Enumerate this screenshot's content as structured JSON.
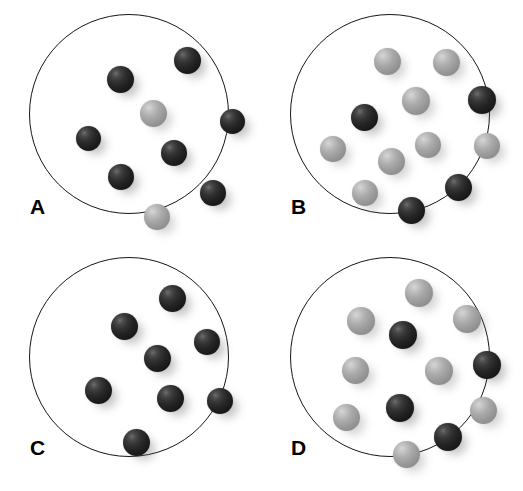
{
  "figure": {
    "background_color": "#ffffff",
    "width": 523,
    "height": 491
  },
  "legend_colors": {
    "dark_sphere": "#242424",
    "light_sphere": "#a5a5a5",
    "dish_outline": "#161616",
    "background": "#ffffff"
  },
  "panels": [
    {
      "id": "panel-a",
      "label": "A",
      "label_x": 30,
      "label_y": 196,
      "dish": {
        "x": 29,
        "y": 14,
        "size": 200
      },
      "counts": {
        "dark": 7,
        "light": 2,
        "total": 9
      },
      "spheres": [
        {
          "type": "dark",
          "x": 145,
          "y": 33,
          "d": 27
        },
        {
          "type": "dark",
          "x": 78,
          "y": 52,
          "d": 27
        },
        {
          "type": "light",
          "x": 111,
          "y": 86,
          "d": 27
        },
        {
          "type": "dark",
          "x": 191,
          "y": 95,
          "d": 25
        },
        {
          "type": "dark",
          "x": 47,
          "y": 112,
          "d": 25
        },
        {
          "type": "dark",
          "x": 132,
          "y": 126,
          "d": 26
        },
        {
          "type": "dark",
          "x": 79,
          "y": 150,
          "d": 26
        },
        {
          "type": "dark",
          "x": 171,
          "y": 166,
          "d": 26
        },
        {
          "type": "light",
          "x": 115,
          "y": 190,
          "d": 26
        }
      ]
    },
    {
      "id": "panel-b",
      "label": "B",
      "label_x": 30,
      "label_y": 196,
      "dish": {
        "x": 29,
        "y": 14,
        "size": 200
      },
      "counts": {
        "dark": 4,
        "light": 8,
        "total": 12
      },
      "spheres": [
        {
          "type": "light",
          "x": 84,
          "y": 34,
          "d": 27
        },
        {
          "type": "light",
          "x": 143,
          "y": 35,
          "d": 27
        },
        {
          "type": "light",
          "x": 112,
          "y": 73,
          "d": 28
        },
        {
          "type": "dark",
          "x": 178,
          "y": 72,
          "d": 28
        },
        {
          "type": "dark",
          "x": 61,
          "y": 90,
          "d": 27
        },
        {
          "type": "light",
          "x": 30,
          "y": 122,
          "d": 26
        },
        {
          "type": "light",
          "x": 125,
          "y": 118,
          "d": 26
        },
        {
          "type": "light",
          "x": 184,
          "y": 119,
          "d": 26
        },
        {
          "type": "light",
          "x": 88,
          "y": 134,
          "d": 27
        },
        {
          "type": "light",
          "x": 62,
          "y": 166,
          "d": 26
        },
        {
          "type": "dark",
          "x": 155,
          "y": 160,
          "d": 27
        },
        {
          "type": "dark",
          "x": 108,
          "y": 183,
          "d": 27
        }
      ]
    },
    {
      "id": "panel-c",
      "label": "C",
      "label_x": 30,
      "label_y": 192,
      "dish": {
        "x": 29,
        "y": 12,
        "size": 200
      },
      "counts": {
        "dark": 8,
        "light": 0,
        "total": 8
      },
      "spheres": [
        {
          "type": "dark",
          "x": 130,
          "y": 28,
          "d": 27
        },
        {
          "type": "dark",
          "x": 82,
          "y": 56,
          "d": 27
        },
        {
          "type": "dark",
          "x": 165,
          "y": 72,
          "d": 26
        },
        {
          "type": "dark",
          "x": 115,
          "y": 88,
          "d": 27
        },
        {
          "type": "dark",
          "x": 56,
          "y": 120,
          "d": 27
        },
        {
          "type": "dark",
          "x": 128,
          "y": 128,
          "d": 27
        },
        {
          "type": "dark",
          "x": 178,
          "y": 131,
          "d": 26
        },
        {
          "type": "dark",
          "x": 94,
          "y": 172,
          "d": 27
        }
      ]
    },
    {
      "id": "panel-d",
      "label": "D",
      "label_x": 30,
      "label_y": 192,
      "dish": {
        "x": 29,
        "y": 12,
        "size": 200
      },
      "counts": {
        "dark": 4,
        "light": 8,
        "total": 12
      },
      "spheres": [
        {
          "type": "light",
          "x": 115,
          "y": 22,
          "d": 28
        },
        {
          "type": "light",
          "x": 57,
          "y": 50,
          "d": 28
        },
        {
          "type": "light",
          "x": 163,
          "y": 48,
          "d": 28
        },
        {
          "type": "dark",
          "x": 99,
          "y": 64,
          "d": 28
        },
        {
          "type": "light",
          "x": 52,
          "y": 100,
          "d": 27
        },
        {
          "type": "light",
          "x": 135,
          "y": 100,
          "d": 28
        },
        {
          "type": "dark",
          "x": 183,
          "y": 94,
          "d": 28
        },
        {
          "type": "dark",
          "x": 96,
          "y": 137,
          "d": 28
        },
        {
          "type": "light",
          "x": 43,
          "y": 147,
          "d": 27
        },
        {
          "type": "light",
          "x": 180,
          "y": 140,
          "d": 27
        },
        {
          "type": "dark",
          "x": 144,
          "y": 166,
          "d": 28
        },
        {
          "type": "light",
          "x": 103,
          "y": 184,
          "d": 27
        }
      ]
    }
  ]
}
